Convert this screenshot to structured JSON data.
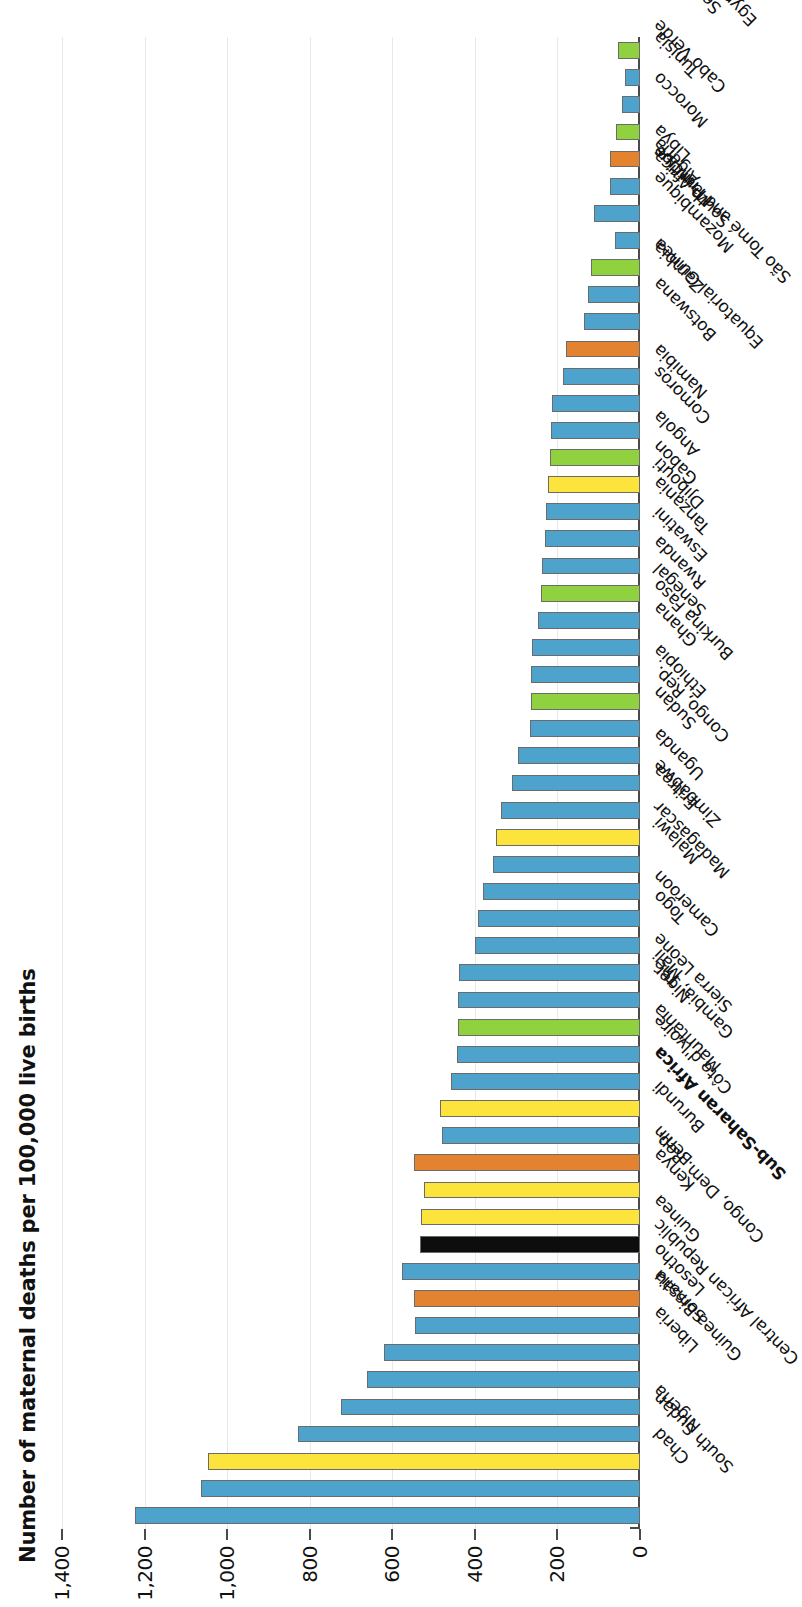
{
  "chart_data": {
    "type": "bar",
    "title": "",
    "xlabel": "",
    "ylabel": "Number of maternal deaths per 100,000 live births",
    "ylim": [
      0,
      1400
    ],
    "yticks": [
      0,
      200,
      400,
      600,
      800,
      1000,
      1200,
      1400
    ],
    "ytick_labels": [
      "0",
      "200",
      "400",
      "600",
      "800",
      "1,000",
      "1,200",
      "1,400"
    ],
    "grid": true,
    "legend": "none",
    "orientation": "vertical-bars-rotated-90",
    "highlight_category": "Sub-Saharan Africa",
    "colors": {
      "blue": "#4EA3CC",
      "green": "#8FD13F",
      "yellow": "#FCE43C",
      "orange": "#E3832F",
      "black": "#0D0D0D",
      "grid": "#e8e8e8",
      "axis": "#4a4a4a",
      "bar_outline": "#6b6b6b"
    },
    "categories": [
      "South Sudan",
      "Chad",
      "Nigeria",
      "Central African Republic",
      "Guinea-Bissau",
      "Liberia",
      "Somalia",
      "Lesotho",
      "Congo, Dem. Rep.",
      "Guinea",
      "Sub-Saharan Africa",
      "Kenya",
      "Benin",
      "Burundi",
      "Côte d'Ivoire",
      "Mauritania",
      "Gambia, The",
      "Sierra Leone",
      "Niger",
      "Mali",
      "Cameroon",
      "Togo",
      "Madagascar",
      "Malawi",
      "Zimbabwe",
      "Eritrea",
      "Uganda",
      "Congo, Rep.",
      "Sudan",
      "Ethiopia",
      "Burkina Faso",
      "Ghana",
      "Senegal",
      "Rwanda",
      "Eswatini",
      "Tanzania",
      "Djibouti",
      "Gabon",
      "Angola",
      "Comoros",
      "Namibia",
      "Equatorial Guinea",
      "Botswana",
      "São Tomé and Principe",
      "Zambia",
      "Mozambique",
      "South Africa",
      "Mauritius",
      "Algeria",
      "Libya",
      "Morocco",
      "Cabo Verde",
      "Tunisia",
      "Egypt, Arab Rep.",
      "Seychelles"
    ],
    "values": [
      1223,
      1063,
      1047,
      829,
      725,
      661,
      621,
      544,
      547,
      576,
      534,
      530,
      523,
      548,
      480,
      485,
      458,
      443,
      441,
      440,
      438,
      399,
      392,
      381,
      357,
      348,
      336,
      311,
      295,
      267,
      264,
      263,
      261,
      248,
      240,
      238,
      229,
      227,
      222,
      217,
      215,
      212,
      186,
      180,
      135,
      127,
      119,
      61,
      112,
      72,
      72,
      58,
      43,
      37,
      53
    ],
    "bar_colors": [
      "blue",
      "blue",
      "yellow",
      "blue",
      "blue",
      "blue",
      "blue",
      "blue",
      "orange",
      "blue",
      "black",
      "yellow",
      "yellow",
      "orange",
      "blue",
      "yellow",
      "blue",
      "blue",
      "green",
      "blue",
      "blue",
      "blue",
      "blue",
      "blue",
      "blue",
      "yellow",
      "blue",
      "blue",
      "blue",
      "blue",
      "green",
      "blue",
      "blue",
      "blue",
      "green",
      "blue",
      "blue",
      "blue",
      "yellow",
      "green",
      "blue",
      "blue",
      "blue",
      "orange",
      "blue",
      "blue",
      "green",
      "blue",
      "blue",
      "blue",
      "orange",
      "green",
      "blue",
      "blue",
      "green"
    ]
  }
}
